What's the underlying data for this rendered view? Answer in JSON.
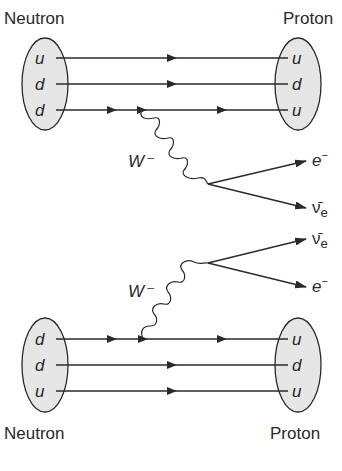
{
  "diagram": {
    "colors": {
      "stroke": "#2a2a2a",
      "hadron_fill": "#e6e6e6",
      "background": "#ffffff"
    },
    "top": {
      "left_label": "Neutron",
      "right_label": "Proton",
      "left_quarks": [
        "u",
        "d",
        "d"
      ],
      "right_quarks": [
        "u",
        "d",
        "u"
      ],
      "boson_label": "W⁻",
      "leptons": [
        {
          "symbol": "e",
          "superscript": "−",
          "subscript": ""
        },
        {
          "symbol": "ν̄",
          "superscript": "",
          "subscript": "e"
        }
      ]
    },
    "bottom": {
      "left_label": "Neutron",
      "right_label": "Proton",
      "left_quarks": [
        "d",
        "d",
        "u"
      ],
      "right_quarks": [
        "u",
        "d",
        "u"
      ],
      "boson_label": "W⁻",
      "leptons": [
        {
          "symbol": "ν̄",
          "superscript": "",
          "subscript": "e"
        },
        {
          "symbol": "e",
          "superscript": "−",
          "subscript": ""
        }
      ]
    }
  }
}
